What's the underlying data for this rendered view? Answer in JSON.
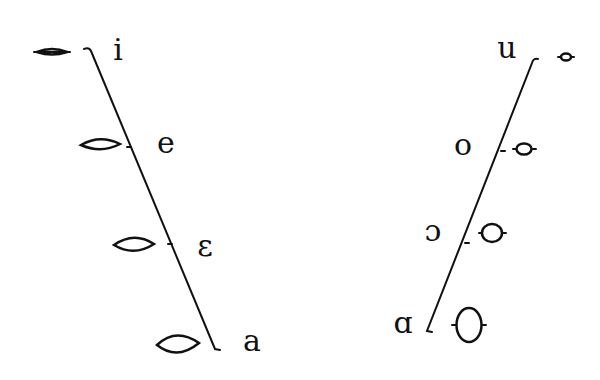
{
  "diagram": {
    "colors": {
      "stroke": "#111111",
      "background": "#ffffff"
    },
    "front_series": {
      "name": "front-vowels",
      "vowels": [
        {
          "symbol": "i",
          "lip_shape": "spread-narrow",
          "label_pos": [
            118,
            52
          ]
        },
        {
          "symbol": "e",
          "lip_shape": "spread",
          "label_pos": [
            166,
            145
          ]
        },
        {
          "symbol": "ε",
          "lip_shape": "spread-open",
          "label_pos": [
            205,
            248
          ]
        },
        {
          "symbol": "a",
          "lip_shape": "open",
          "label_pos": [
            252,
            343
          ]
        }
      ]
    },
    "back_series": {
      "name": "back-vowels",
      "vowels": [
        {
          "symbol": "u",
          "lip_shape": "rounded-small",
          "label_pos": [
            507,
            50
          ]
        },
        {
          "symbol": "o",
          "lip_shape": "rounded",
          "label_pos": [
            463,
            147
          ]
        },
        {
          "symbol": "ɔ",
          "lip_shape": "rounded-open",
          "label_pos": [
            433,
            233
          ]
        },
        {
          "symbol": "ɑ",
          "lip_shape": "rounded-large",
          "label_pos": [
            403,
            325
          ]
        }
      ]
    }
  }
}
